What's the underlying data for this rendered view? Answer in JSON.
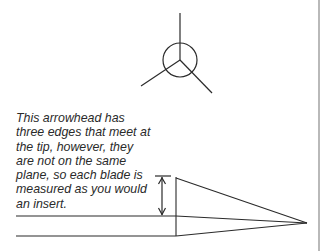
{
  "caption": {
    "lines": [
      "This arrowhead has",
      "three edges that meet at",
      "the tip, however, they",
      "are not on the same",
      "plane, so each blade is",
      "measured as you would",
      "an insert."
    ]
  },
  "colors": {
    "line": "#2a2a2a",
    "border": "#8a8a8a",
    "background": "#ffffff"
  }
}
